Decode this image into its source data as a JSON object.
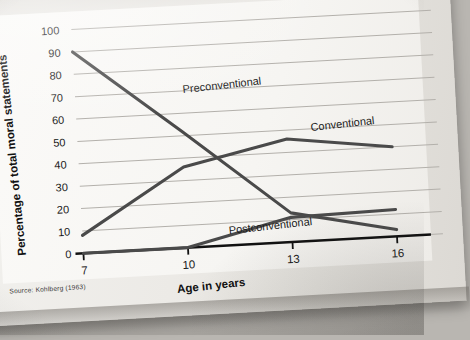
{
  "figure": {
    "caption_partial": "ts at ages 13 and 16.",
    "source_note": "Source: Kohlberg (1963)"
  },
  "chart_data": {
    "type": "line",
    "title": "",
    "xlabel": "Age in years",
    "ylabel": "Percentage of total moral statements",
    "x": [
      7,
      10,
      13,
      16
    ],
    "xtick_labels": [
      "7",
      "10",
      "13",
      "16"
    ],
    "ytick_labels": [
      "0",
      "10",
      "20",
      "30",
      "40",
      "50",
      "60",
      "70",
      "80",
      "90",
      "100"
    ],
    "ylim": [
      0,
      100
    ],
    "xlim": [
      7,
      16
    ],
    "grid": "horizontal",
    "legend": "inline-annotations",
    "series": [
      {
        "name": "Preconventional",
        "values": [
          90,
          52,
          13,
          3
        ],
        "label_x": 10.1,
        "label_y": 69,
        "color": "#4a4a4a"
      },
      {
        "name": "Conventional",
        "values": [
          8,
          36,
          46,
          40
        ],
        "label_x": 13.7,
        "label_y": 49,
        "color": "#4a4a4a"
      },
      {
        "name": "Postconventional",
        "values": [
          0,
          0,
          11,
          12
        ],
        "label_x": 11.2,
        "label_y": 5,
        "color": "#4a4a4a"
      }
    ]
  },
  "axis": {
    "y_ticks": [
      0,
      10,
      20,
      30,
      40,
      50,
      60,
      70,
      80,
      90,
      100
    ],
    "x_ticks": [
      7,
      10,
      13,
      16
    ]
  },
  "colors": {
    "line": "#4a4a4a",
    "axis": "#111111",
    "grid": "#b3b0ab",
    "page": "#f3f1ee",
    "backdrop": "#b9b6b1"
  },
  "labels": {
    "y0": "0",
    "y10": "10",
    "y20": "20",
    "y30": "30",
    "y40": "40",
    "y50": "50",
    "y60": "60",
    "y70": "70",
    "y80": "80",
    "y90": "90",
    "y100": "100",
    "x7": "7",
    "x10": "10",
    "x13": "13",
    "x16": "16",
    "x_title": "Age in years",
    "y_title": "Percentage of total moral statements",
    "s1": "Preconventional",
    "s2": "Conventional",
    "s3": "Postconventional"
  }
}
